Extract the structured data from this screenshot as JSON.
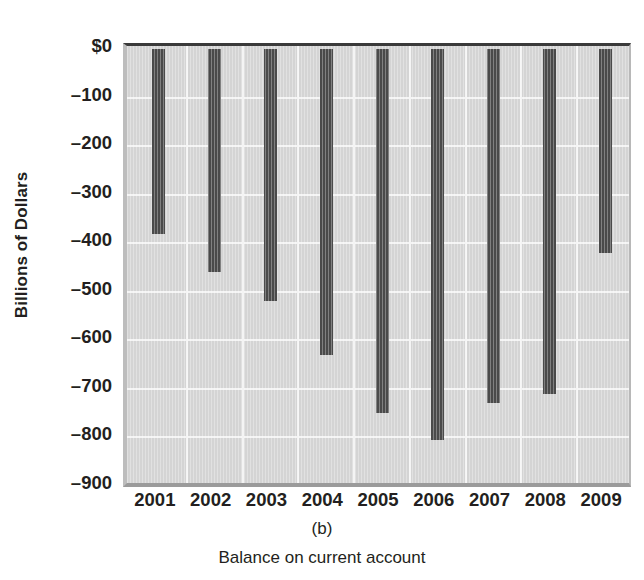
{
  "chart_data": {
    "type": "bar",
    "title": "",
    "panel_label": "(b)",
    "caption": "Balance on current account",
    "xlabel": "",
    "ylabel": "Billions of Dollars",
    "categories": [
      "2001",
      "2002",
      "2003",
      "2004",
      "2005",
      "2006",
      "2007",
      "2008",
      "2009"
    ],
    "values": [
      -380,
      -460,
      -520,
      -630,
      -750,
      -805,
      -730,
      -710,
      -420
    ],
    "series": [
      {
        "name": "Balance on current account",
        "values": [
          -380,
          -460,
          -520,
          -630,
          -750,
          -805,
          -730,
          -710,
          -420
        ]
      }
    ],
    "ylim": [
      -900,
      0
    ],
    "ytick_values": [
      0,
      -100,
      -200,
      -300,
      -400,
      -500,
      -600,
      -700,
      -800,
      -900
    ],
    "ytick_labels": [
      "$0",
      "–100",
      "–200",
      "–300",
      "–400",
      "–500",
      "–600",
      "–700",
      "–800",
      "–900"
    ],
    "grid": true,
    "grid_axis": "both",
    "legend": "none",
    "bar_color": "#4a4a4a",
    "plot_background": "#d4d4d4",
    "gridline_color": "#f4f4f4",
    "text_color": "#231f20"
  }
}
